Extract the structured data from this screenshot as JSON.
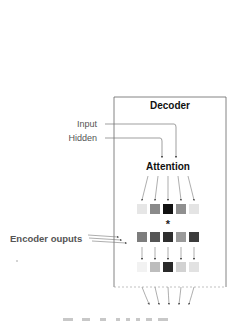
{
  "diagram": {
    "title": "Decoder",
    "attention_label": "Attention",
    "input_label": "Input",
    "hidden_label": "Hidden",
    "encoder_label": "Encoder ouputs",
    "multiply_symbol": "*",
    "caption": "",
    "rows": {
      "attention_weights": [
        "#e6e6e6",
        "#8a8a8a",
        "#111111",
        "#8f8f8f",
        "#e4e4e4"
      ],
      "encoder_outputs": [
        "#7d7d7d",
        "#555555",
        "#2e2e2e",
        "#9a9a9a",
        "#3c3c3c"
      ],
      "weighted_outputs": [
        "#f2f2f2",
        "#bdbdbd",
        "#2a2a2a",
        "#d2d2d2",
        "#e2e2e2"
      ]
    },
    "colors": {
      "stroke": "#555555",
      "box_border": "#666666"
    }
  }
}
